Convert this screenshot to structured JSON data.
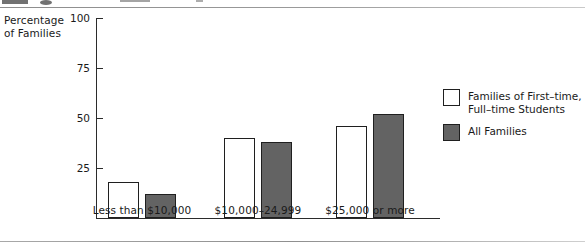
{
  "chart_data": {
    "type": "bar",
    "title": "",
    "xlabel": "",
    "ylabel": "Percentage\nof Families",
    "categories": [
      "Less than $10,000",
      "$10,000–24,999",
      "$25,000 or more"
    ],
    "series": [
      {
        "name": "Families of First-time,\nFull-time Students",
        "values": [
          18,
          40,
          46
        ],
        "color": "#ffffff",
        "border": "#1f1f1f"
      },
      {
        "name": "All Families",
        "values": [
          12,
          38,
          52
        ],
        "color": "#636363",
        "border": "#1f1f1f"
      }
    ],
    "ylim": [
      0,
      100
    ],
    "yticks": [
      25,
      50,
      75,
      100
    ],
    "ytick_labels": [
      "25",
      "50",
      "75",
      "100"
    ],
    "grid": false,
    "legend_position": "right"
  },
  "axis": {
    "title_line1": "Percentage",
    "title_line2": "of Families"
  },
  "legend": {
    "entries": [
      {
        "label": "Families of First–time,\nFull–time Students",
        "swatch": "open"
      },
      {
        "label": "All Families",
        "swatch": "filled"
      }
    ]
  }
}
